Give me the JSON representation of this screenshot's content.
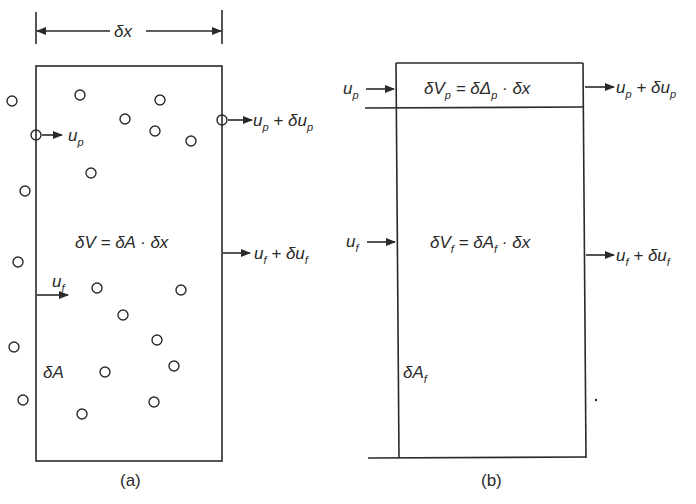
{
  "figure": {
    "panel_a": {
      "caption": "(a)",
      "dimension_label": "δx",
      "volume_equation": "δV = δA · δx",
      "area_label": "δA",
      "inlet_particle_velocity": {
        "base": "u",
        "sub": "p"
      },
      "outlet_particle_velocity": {
        "base": "u",
        "sub": "p",
        "rest": " + δu",
        "sub2": "p"
      },
      "inlet_fluid_velocity": {
        "base": "u",
        "sub": "f"
      },
      "outlet_fluid_velocity": {
        "base": "u",
        "sub": "f",
        "rest": " + δu",
        "sub2": "f"
      },
      "particles": [
        [
          12,
          101
        ],
        [
          80,
          95
        ],
        [
          160,
          100
        ],
        [
          125,
          119
        ],
        [
          155,
          131
        ],
        [
          191,
          141
        ],
        [
          36,
          135
        ],
        [
          222,
          120
        ],
        [
          91,
          173
        ],
        [
          25,
          191
        ],
        [
          18,
          262
        ],
        [
          97,
          288
        ],
        [
          181,
          290
        ],
        [
          123,
          315
        ],
        [
          157,
          340
        ],
        [
          14,
          347
        ],
        [
          105,
          372
        ],
        [
          174,
          366
        ],
        [
          23,
          400
        ],
        [
          154,
          402
        ],
        [
          82,
          414
        ]
      ]
    },
    "panel_b": {
      "caption": "(b)",
      "particle_volume_equation": {
        "a": "δV",
        "a_sub": "p",
        "b": " = δΔ",
        "b_sub": "p",
        "c": " · δx"
      },
      "fluid_volume_equation": {
        "a": "δV",
        "a_sub": "f",
        "b": " =  δA",
        "b_sub": "f",
        "c": " · δx"
      },
      "area_label": {
        "base": "δA",
        "sub": "f"
      },
      "inlet_particle_velocity": {
        "base": "u",
        "sub": "p"
      },
      "outlet_particle_velocity": {
        "base": "u",
        "sub": "p",
        "rest": " + δu",
        "sub2": "p"
      },
      "inlet_fluid_velocity": {
        "base": "u",
        "sub": "f"
      },
      "outlet_fluid_velocity": {
        "base": "u",
        "sub": "f",
        "rest": " + δu",
        "sub2": "f"
      }
    }
  }
}
